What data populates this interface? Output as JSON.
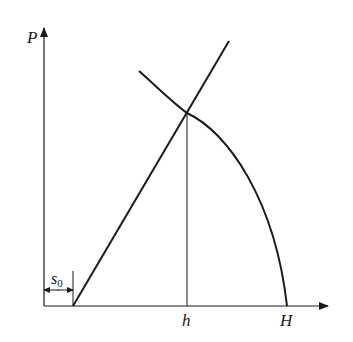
{
  "diagram": {
    "axes": {
      "y_label": "P",
      "x_labels": {
        "h": "h",
        "H": "H"
      },
      "offset_label": "s",
      "offset_subscript": "0"
    },
    "elements": [
      "straight-line",
      "descending-curve",
      "intersection-vertical-line",
      "s0-dimension-arrow"
    ],
    "colors": {
      "stroke": "#1a1a1a",
      "background": "#ffffff"
    }
  }
}
